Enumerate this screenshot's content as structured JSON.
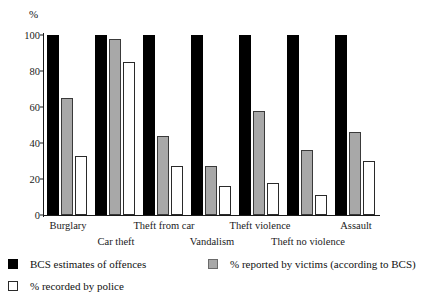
{
  "chart_data": {
    "type": "bar",
    "title": "",
    "subtitle": "",
    "xlabel": "",
    "ylabel": "%",
    "ylim": [
      0,
      100
    ],
    "yticks": [
      0,
      20,
      40,
      60,
      80,
      100
    ],
    "grid": false,
    "legend_position": "bottom-left",
    "categories": [
      "Burglary",
      "Car theft",
      "Theft from car",
      "Vandalism",
      "Theft violence",
      "Theft no violence",
      "Assault"
    ],
    "series": [
      {
        "name": "BCS estimates of offences",
        "color": "#000000",
        "values": [
          100,
          100,
          100,
          100,
          100,
          100,
          100
        ]
      },
      {
        "name": "% reported by victims (according to BCS)",
        "color": "#a8a8a8",
        "values": [
          65,
          98,
          44,
          27,
          58,
          36,
          46
        ]
      },
      {
        "name": "% recorded by police",
        "color": "#ffffff",
        "values": [
          33,
          85,
          27,
          16,
          18,
          11,
          30
        ]
      }
    ],
    "legend": [
      "BCS estimates of offences",
      "% reported by victims (according to BCS)",
      "% recorded by police"
    ]
  },
  "axis": {
    "unit_label": "%",
    "tick_labels": [
      "100",
      "80",
      "60",
      "40",
      "20",
      "0"
    ]
  },
  "category_labels": [
    {
      "text": "Burglary",
      "row": "top"
    },
    {
      "text": "Car theft",
      "row": "bottom"
    },
    {
      "text": "Theft from car",
      "row": "top"
    },
    {
      "text": "Vandalism",
      "row": "bottom"
    },
    {
      "text": "Theft violence",
      "row": "top"
    },
    {
      "text": "Theft no violence",
      "row": "bottom"
    },
    {
      "text": "Assault",
      "row": "top"
    }
  ],
  "legend_items": [
    {
      "label": "BCS estimates of offences",
      "swatch": "black"
    },
    {
      "label": "% reported by victims (according to BCS)",
      "swatch": "gray"
    },
    {
      "label": "% recorded by police",
      "swatch": "white"
    }
  ]
}
